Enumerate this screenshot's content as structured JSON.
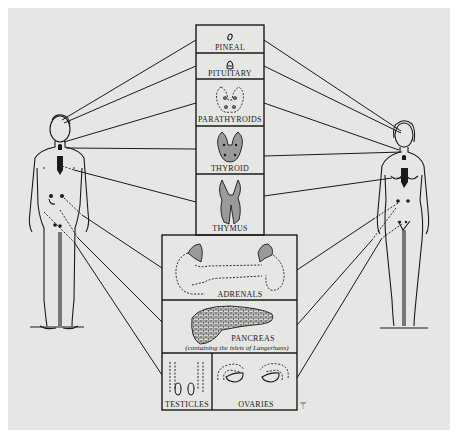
{
  "diagram": {
    "background_color": "#e6e6e4",
    "line_color": "#1a1a1a",
    "figures": [
      {
        "name": "male-figure",
        "sex": "male",
        "position": "left"
      },
      {
        "name": "female-figure",
        "sex": "female",
        "position": "right"
      }
    ],
    "glands": [
      {
        "id": "pineal",
        "label": "PINEAL"
      },
      {
        "id": "pituitary",
        "label": "PITUITARY"
      },
      {
        "id": "parathyroids",
        "label": "PARATHYROIDS"
      },
      {
        "id": "thyroid",
        "label": "THYROID"
      },
      {
        "id": "thymus",
        "label": "THYMUS"
      },
      {
        "id": "adrenals",
        "label": "ADRENALS"
      },
      {
        "id": "pancreas",
        "label": "PANCREAS",
        "note": "(containing the islets of Langerhans)"
      },
      {
        "id": "testicles",
        "label": "TESTICLES"
      },
      {
        "id": "ovaries",
        "label": "OVARIES"
      }
    ],
    "signature_mark": "⚚"
  }
}
